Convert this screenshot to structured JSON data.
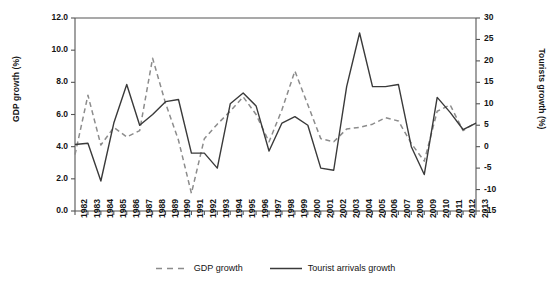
{
  "chart_data": {
    "type": "line",
    "title": "",
    "subtitle": "",
    "xlabel": "",
    "ylabel": "GDP growth (%)",
    "y2label": "Tourists growth (%)",
    "grid": false,
    "legend_position": "bottom-center",
    "ylim": [
      0,
      12
    ],
    "y2lim": [
      -15,
      30
    ],
    "yticks": [
      "0.0",
      "2.0",
      "4.0",
      "6.0",
      "8.0",
      "10.0",
      "12.0"
    ],
    "ytick_values": [
      0,
      2,
      4,
      6,
      8,
      10,
      12
    ],
    "y2ticks": [
      "-15",
      "-10",
      "-5",
      "0",
      "5",
      "10",
      "15",
      "20",
      "25",
      "30"
    ],
    "y2tick_values": [
      -15,
      -10,
      -5,
      0,
      5,
      10,
      15,
      20,
      25,
      30
    ],
    "x": [
      "1982",
      "1983",
      "1984",
      "1985",
      "1986",
      "1987",
      "1988",
      "1989",
      "1990",
      "1991",
      "1992",
      "1993",
      "1994",
      "1995",
      "1996",
      "1997",
      "1998",
      "1999",
      "2000",
      "2001",
      "2002",
      "2003",
      "2004",
      "2005",
      "2006",
      "2007",
      "2008",
      "2009",
      "2010",
      "2011",
      "2012",
      "2013"
    ],
    "series": [
      {
        "name": "GDP growth",
        "axis": "left",
        "style": "dashed",
        "color": "#8c8c8c",
        "values": [
          3.5,
          7.2,
          4.1,
          5.2,
          4.6,
          5.0,
          9.5,
          6.7,
          4.4,
          1.1,
          4.5,
          5.4,
          6.2,
          7.1,
          6.0,
          4.3,
          6.3,
          8.7,
          6.6,
          4.5,
          4.3,
          5.1,
          5.2,
          5.4,
          5.8,
          5.6,
          4.2,
          3.1,
          6.2,
          6.6,
          5.0,
          5.5
        ]
      },
      {
        "name": "Tourist arrivals growth",
        "axis": "right",
        "style": "solid",
        "color": "#3a3a3a",
        "values": [
          0.5,
          0.8,
          -8.0,
          5.5,
          14.5,
          5.0,
          7.5,
          10.5,
          11.0,
          -1.5,
          -1.5,
          -5.0,
          10.0,
          12.5,
          9.5,
          -1.0,
          5.5,
          7.0,
          5.0,
          -5.0,
          -5.5,
          14.0,
          26.5,
          14.0,
          14.0,
          14.5,
          0.0,
          -6.5,
          11.5,
          8.0,
          4.0,
          5.5
        ]
      }
    ],
    "legend": [
      {
        "label": "GDP growth",
        "style": "dashed",
        "color": "#8c8c8c"
      },
      {
        "label": "Tourist arrivals growth",
        "style": "solid",
        "color": "#3a3a3a"
      }
    ]
  },
  "axes": {
    "left_title": "GDP growth (%)",
    "right_title": "Tourists growth (%)"
  }
}
